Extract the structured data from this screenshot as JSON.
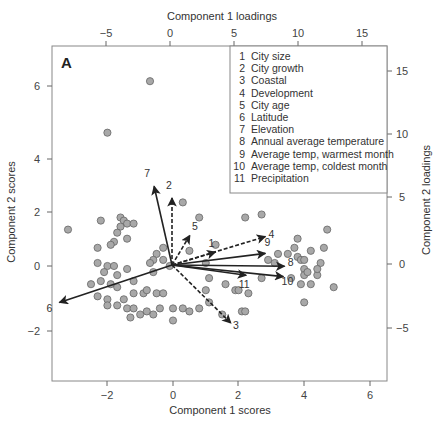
{
  "chart_data": {
    "type": "scatter",
    "subtype": "biplot",
    "panel_label": "A",
    "title": "",
    "xlabel": "Component 1 scores",
    "ylabel": "Component 2 scores",
    "x2label": "Component 1 loadings",
    "y2label": "Component 2 loadings",
    "xlim": [
      -3.5,
      6.5
    ],
    "ylim": [
      -3.6,
      7.3
    ],
    "x_ticks": [
      -2,
      0,
      2,
      4,
      6
    ],
    "y_ticks": [
      -2,
      0,
      2,
      4,
      6
    ],
    "x2_ticks": [
      -5,
      0,
      5,
      10,
      15
    ],
    "y2_ticks": [
      -5,
      0,
      5,
      10,
      15
    ],
    "grid": false,
    "legend_position": "top-right",
    "legend": [
      {
        "num": "1",
        "label": "City size"
      },
      {
        "num": "2",
        "label": "City growth"
      },
      {
        "num": "3",
        "label": "Coastal"
      },
      {
        "num": "4",
        "label": "Development"
      },
      {
        "num": "5",
        "label": "City age"
      },
      {
        "num": "6",
        "label": "Latitude"
      },
      {
        "num": "7",
        "label": "Elevation"
      },
      {
        "num": "8",
        "label": "Annual average temperature"
      },
      {
        "num": "9",
        "label": "Average temp, warmest month"
      },
      {
        "num": "10",
        "label": "Average temp, coldest month"
      },
      {
        "num": "11",
        "label": "Precipitation"
      }
    ],
    "loadings": [
      {
        "id": "1",
        "x": 3.4,
        "y": 1.0,
        "dashed": true
      },
      {
        "id": "2",
        "x": 0.0,
        "y": 5.2,
        "dashed": true
      },
      {
        "id": "3",
        "x": 4.6,
        "y": -4.5,
        "dashed": true
      },
      {
        "id": "4",
        "x": 7.3,
        "y": 2.2,
        "dashed": true
      },
      {
        "id": "5",
        "x": 1.4,
        "y": 2.3,
        "dashed": true
      },
      {
        "id": "6",
        "x": -8.8,
        "y": -2.9,
        "dashed": false
      },
      {
        "id": "7",
        "x": -1.4,
        "y": 6.1,
        "dashed": false
      },
      {
        "id": "8",
        "x": 8.8,
        "y": -0.1,
        "dashed": false
      },
      {
        "id": "9",
        "x": 7.3,
        "y": 0.9,
        "dashed": false
      },
      {
        "id": "10",
        "x": 8.7,
        "y": -0.9,
        "dashed": false
      },
      {
        "id": "11",
        "x": 5.8,
        "y": -0.8,
        "dashed": false
      }
    ],
    "scores": [
      [
        -0.7,
        6.1
      ],
      [
        -2.0,
        4.4
      ],
      [
        4.7,
        1.2
      ],
      [
        0.8,
        1.6
      ],
      [
        2.2,
        1.6
      ],
      [
        2.7,
        1.7
      ],
      [
        -3.2,
        1.2
      ],
      [
        -2.2,
        1.5
      ],
      [
        -1.6,
        1.6
      ],
      [
        -1.5,
        1.5
      ],
      [
        -1.4,
        1.4
      ],
      [
        -1.2,
        1.4
      ],
      [
        -1.6,
        1.3
      ],
      [
        -1.7,
        1.1
      ],
      [
        -1.4,
        0.9
      ],
      [
        -1.8,
        0.8
      ],
      [
        -1.9,
        0.7
      ],
      [
        -2.3,
        0.6
      ],
      [
        -0.5,
        0.4
      ],
      [
        -0.6,
        0.2
      ],
      [
        -0.3,
        0.2
      ],
      [
        -0.3,
        0.6
      ],
      [
        0.5,
        0.5
      ],
      [
        1.3,
        0.7
      ],
      [
        -2.3,
        0.1
      ],
      [
        -2.0,
        0.0
      ],
      [
        -1.8,
        0.0
      ],
      [
        -2.1,
        -0.2
      ],
      [
        -1.7,
        -0.3
      ],
      [
        -1.4,
        -0.1
      ],
      [
        -0.6,
        -0.2
      ],
      [
        -0.1,
        0.0
      ],
      [
        -0.7,
        0.1
      ],
      [
        -2.5,
        -0.6
      ],
      [
        -2.2,
        -0.5
      ],
      [
        -1.9,
        -0.6
      ],
      [
        -1.7,
        -0.7
      ],
      [
        -1.2,
        -0.5
      ],
      [
        -1.2,
        -0.9
      ],
      [
        -0.9,
        -0.9
      ],
      [
        -0.8,
        -0.8
      ],
      [
        -0.5,
        -0.9
      ],
      [
        -0.3,
        -0.9
      ],
      [
        -2.3,
        -1.0
      ],
      [
        -2.0,
        -1.1
      ],
      [
        -2.0,
        -1.3
      ],
      [
        -1.7,
        -1.3
      ],
      [
        -1.5,
        -1.1
      ],
      [
        -1.4,
        -1.4
      ],
      [
        -1.2,
        -1.4
      ],
      [
        -0.8,
        -1.5
      ],
      [
        -0.6,
        -1.6
      ],
      [
        0.0,
        -1.4
      ],
      [
        0.0,
        -1.8
      ],
      [
        -1.3,
        -1.7
      ],
      [
        -1.0,
        -1.6
      ],
      [
        -0.4,
        -1.4
      ],
      [
        0.3,
        -1.4
      ],
      [
        0.5,
        -1.5
      ],
      [
        0.8,
        -1.4
      ],
      [
        1.5,
        -1.6
      ],
      [
        2.1,
        -1.5
      ],
      [
        2.2,
        -1.5
      ],
      [
        1.1,
        -1.2
      ],
      [
        1.0,
        -0.8
      ],
      [
        1.1,
        -0.4
      ],
      [
        1.6,
        -0.6
      ],
      [
        1.9,
        -0.8
      ],
      [
        2.0,
        -0.8
      ],
      [
        2.3,
        -0.9
      ],
      [
        2.7,
        -0.4
      ],
      [
        2.9,
        0.2
      ],
      [
        3.5,
        0.4
      ],
      [
        3.7,
        0.6
      ],
      [
        3.8,
        0.9
      ],
      [
        3.8,
        0.3
      ],
      [
        3.9,
        0.2
      ],
      [
        4.0,
        0.2
      ],
      [
        4.2,
        0.5
      ],
      [
        4.6,
        0.6
      ],
      [
        4.5,
        0.1
      ],
      [
        4.0,
        -0.1
      ],
      [
        4.0,
        -0.3
      ],
      [
        4.1,
        -0.2
      ],
      [
        4.4,
        -0.3
      ],
      [
        3.9,
        -0.6
      ],
      [
        4.2,
        -0.6
      ],
      [
        4.4,
        -0.1
      ],
      [
        4.9,
        -0.7
      ],
      [
        4.0,
        -1.2
      ],
      [
        3.6,
        -0.4
      ],
      [
        3.2,
        0.4
      ],
      [
        3.1,
        0.1
      ],
      [
        1.0,
        0.1
      ],
      [
        0.3,
        2.1
      ]
    ]
  },
  "page": {
    "panel_label": "A",
    "x_axis_title": "Component 1 scores",
    "y_axis_title": "Component 2 scores",
    "top_axis_title": "Component 1 loadings",
    "right_axis_title": "Component 2 loadings",
    "x_tick_labels": [
      "−2",
      "0",
      "2",
      "4",
      "6"
    ],
    "y_tick_labels": [
      "6",
      "4",
      "2",
      "0",
      "−2"
    ],
    "top_tick_labels": [
      "−5",
      "0",
      "5",
      "10",
      "15"
    ],
    "right_tick_labels": [
      "15",
      "10",
      "5",
      "0",
      "−5"
    ]
  },
  "colors": {
    "point_fill": "#a8a8a8",
    "point_stroke": "#666666",
    "arrow": "#222222",
    "frame": "#888888"
  }
}
